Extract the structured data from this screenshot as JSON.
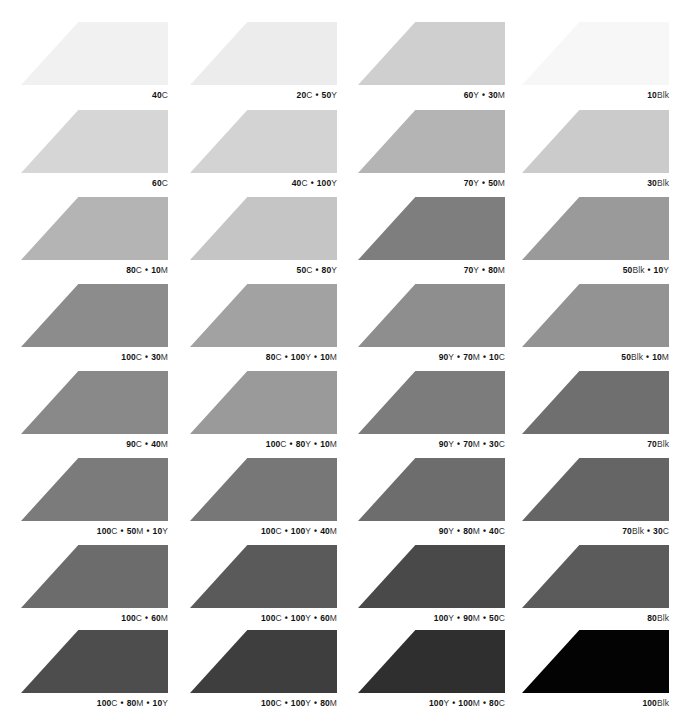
{
  "columns": 4,
  "rows": 8,
  "swatches": [
    {
      "row": 0,
      "col": 0,
      "label_parts": [
        [
          "40",
          "C"
        ]
      ],
      "color": "#f1f1f1"
    },
    {
      "row": 0,
      "col": 1,
      "label_parts": [
        [
          "20",
          "C"
        ],
        [
          "50",
          "Y"
        ]
      ],
      "color": "#ececec"
    },
    {
      "row": 0,
      "col": 2,
      "label_parts": [
        [
          "60",
          "Y"
        ],
        [
          "30",
          "M"
        ]
      ],
      "color": "#cfcfcf"
    },
    {
      "row": 0,
      "col": 3,
      "label_parts": [
        [
          "10",
          "Blk"
        ]
      ],
      "color": "#f7f7f7"
    },
    {
      "row": 1,
      "col": 0,
      "label_parts": [
        [
          "60",
          "C"
        ]
      ],
      "color": "#d6d6d6"
    },
    {
      "row": 1,
      "col": 1,
      "label_parts": [
        [
          "40",
          "C"
        ],
        [
          "100",
          "Y"
        ]
      ],
      "color": "#d3d3d3"
    },
    {
      "row": 1,
      "col": 2,
      "label_parts": [
        [
          "70",
          "Y"
        ],
        [
          "50",
          "M"
        ]
      ],
      "color": "#b4b4b4"
    },
    {
      "row": 1,
      "col": 3,
      "label_parts": [
        [
          "30",
          "Blk"
        ]
      ],
      "color": "#cbcbcb"
    },
    {
      "row": 2,
      "col": 0,
      "label_parts": [
        [
          "80",
          "C"
        ],
        [
          "10",
          "M"
        ]
      ],
      "color": "#b4b4b4"
    },
    {
      "row": 2,
      "col": 1,
      "label_parts": [
        [
          "50",
          "C"
        ],
        [
          "80",
          "Y"
        ]
      ],
      "color": "#c5c5c5"
    },
    {
      "row": 2,
      "col": 2,
      "label_parts": [
        [
          "70",
          "Y"
        ],
        [
          "80",
          "M"
        ]
      ],
      "color": "#7e7e7e"
    },
    {
      "row": 2,
      "col": 3,
      "label_parts": [
        [
          "50",
          "Blk"
        ],
        [
          "10",
          "Y"
        ]
      ],
      "color": "#9a9a9a"
    },
    {
      "row": 3,
      "col": 0,
      "label_parts": [
        [
          "100",
          "C"
        ],
        [
          "30",
          "M"
        ]
      ],
      "color": "#8c8c8c"
    },
    {
      "row": 3,
      "col": 1,
      "label_parts": [
        [
          "80",
          "C"
        ],
        [
          "100",
          "Y"
        ],
        [
          "10",
          "M"
        ]
      ],
      "color": "#a2a2a2"
    },
    {
      "row": 3,
      "col": 2,
      "label_parts": [
        [
          "90",
          "Y"
        ],
        [
          "70",
          "M"
        ],
        [
          "10",
          "C"
        ]
      ],
      "color": "#8e8e8e"
    },
    {
      "row": 3,
      "col": 3,
      "label_parts": [
        [
          "50",
          "Blk"
        ],
        [
          "10",
          "M"
        ]
      ],
      "color": "#939393"
    },
    {
      "row": 4,
      "col": 0,
      "label_parts": [
        [
          "90",
          "C"
        ],
        [
          "40",
          "M"
        ]
      ],
      "color": "#898989"
    },
    {
      "row": 4,
      "col": 1,
      "label_parts": [
        [
          "100",
          "C"
        ],
        [
          "80",
          "Y"
        ],
        [
          "10",
          "M"
        ]
      ],
      "color": "#9a9a9a"
    },
    {
      "row": 4,
      "col": 2,
      "label_parts": [
        [
          "90",
          "Y"
        ],
        [
          "70",
          "M"
        ],
        [
          "30",
          "C"
        ]
      ],
      "color": "#7c7c7c"
    },
    {
      "row": 4,
      "col": 3,
      "label_parts": [
        [
          "70",
          "Blk"
        ]
      ],
      "color": "#6f6f6f"
    },
    {
      "row": 5,
      "col": 0,
      "label_parts": [
        [
          "100",
          "C"
        ],
        [
          "50",
          "M"
        ],
        [
          "10",
          "Y"
        ]
      ],
      "color": "#7b7b7b"
    },
    {
      "row": 5,
      "col": 1,
      "label_parts": [
        [
          "100",
          "C"
        ],
        [
          "100",
          "Y"
        ],
        [
          "40",
          "M"
        ]
      ],
      "color": "#777777"
    },
    {
      "row": 5,
      "col": 2,
      "label_parts": [
        [
          "90",
          "Y"
        ],
        [
          "80",
          "M"
        ],
        [
          "40",
          "C"
        ]
      ],
      "color": "#6d6d6d"
    },
    {
      "row": 5,
      "col": 3,
      "label_parts": [
        [
          "70",
          "Blk"
        ],
        [
          "30",
          "C"
        ]
      ],
      "color": "#656565"
    },
    {
      "row": 6,
      "col": 0,
      "label_parts": [
        [
          "100",
          "C"
        ],
        [
          "60",
          "M"
        ]
      ],
      "color": "#6c6c6c"
    },
    {
      "row": 6,
      "col": 1,
      "label_parts": [
        [
          "100",
          "C"
        ],
        [
          "100",
          "Y"
        ],
        [
          "60",
          "M"
        ]
      ],
      "color": "#5a5a5a"
    },
    {
      "row": 6,
      "col": 2,
      "label_parts": [
        [
          "100",
          "Y"
        ],
        [
          "90",
          "M"
        ],
        [
          "50",
          "C"
        ]
      ],
      "color": "#494949"
    },
    {
      "row": 6,
      "col": 3,
      "label_parts": [
        [
          "80",
          "Blk"
        ]
      ],
      "color": "#5b5b5b"
    },
    {
      "row": 7,
      "col": 0,
      "label_parts": [
        [
          "100",
          "C"
        ],
        [
          "80",
          "M"
        ],
        [
          "10",
          "Y"
        ]
      ],
      "color": "#4d4d4d"
    },
    {
      "row": 7,
      "col": 1,
      "label_parts": [
        [
          "100",
          "C"
        ],
        [
          "100",
          "Y"
        ],
        [
          "80",
          "M"
        ]
      ],
      "color": "#3e3e3e"
    },
    {
      "row": 7,
      "col": 2,
      "label_parts": [
        [
          "100",
          "Y"
        ],
        [
          "100",
          "M"
        ],
        [
          "80",
          "C"
        ]
      ],
      "color": "#2f2f2f"
    },
    {
      "row": 7,
      "col": 3,
      "label_parts": [
        [
          "100",
          "Blk"
        ]
      ],
      "color": "#030303"
    }
  ],
  "separator": "•"
}
